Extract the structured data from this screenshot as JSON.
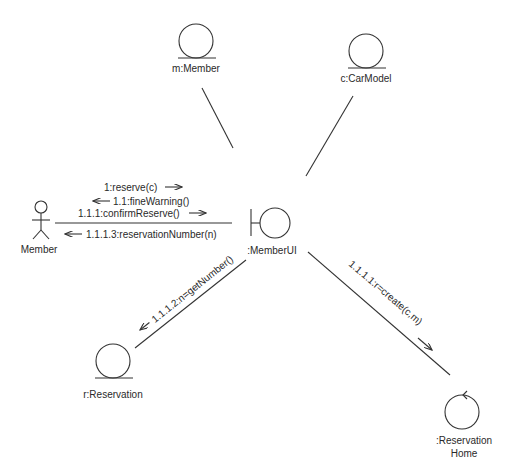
{
  "diagram": {
    "type": "UML communication diagram",
    "objects": [
      {
        "id": "actor",
        "label": "Member",
        "kind": "actor"
      },
      {
        "id": "m",
        "label": "m:Member",
        "kind": "entity"
      },
      {
        "id": "c",
        "label": "c:CarModel",
        "kind": "entity"
      },
      {
        "id": "ui",
        "label": ":MemberUI",
        "kind": "boundary"
      },
      {
        "id": "r",
        "label": "r:Reservation",
        "kind": "entity"
      },
      {
        "id": "home",
        "label_line1": ":Reservation",
        "label_line2": "Home",
        "kind": "control"
      }
    ],
    "messages": [
      {
        "label": "1:reserve(c)",
        "direction": "to-ui"
      },
      {
        "label": "1.1:fineWarning()",
        "direction": "to-actor"
      },
      {
        "label": "1.1.1:confirmReserve()",
        "direction": "to-ui"
      },
      {
        "label": "1.1.1.3:reservationNumber(n)",
        "direction": "to-actor"
      },
      {
        "label": "1.1.1.2:n=getNumber()",
        "direction": "to-reservation"
      },
      {
        "label": "1.1.1.1:r=create(c,m)",
        "direction": "to-home"
      }
    ]
  }
}
